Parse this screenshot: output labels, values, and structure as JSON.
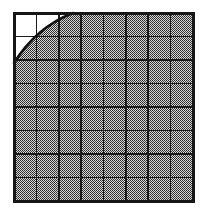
{
  "figure": {
    "type": "geometric-diagram",
    "canvas": {
      "width": 206,
      "height": 214,
      "background": "#ffffff"
    },
    "plot_area": {
      "left": 14,
      "top": 13,
      "right": 193,
      "bottom": 201,
      "width": 179,
      "height": 188
    },
    "grid": {
      "columns": 8,
      "rows": 8,
      "cell_width": 22.375,
      "cell_height": 23.5,
      "line_color": "#1a1a1a",
      "inner_line_width": 1.6,
      "border_line_width": 3.0,
      "border_color": "#161616"
    },
    "arc": {
      "shape": "quarter-circle",
      "concavity": "toward-top-left",
      "stroke_color": "#111111",
      "stroke_width": 2.6,
      "center_x": 193,
      "center_y": 201,
      "radius_x": 120,
      "radius_y": 138,
      "start_point_label": "top-edge-crossing",
      "start_x": 73,
      "start_y": 13,
      "end_point_label": "left-edge-crossing",
      "end_x": 14,
      "end_y": 63
    },
    "fill": {
      "region": "outside-arc",
      "pattern": "stipple-dots",
      "pattern_period_px": 2,
      "dot_color": "#2b2b2b",
      "background_color": "#d6d6d6",
      "unfilled_color": "#ffffff"
    },
    "unfilled_cells": [
      {
        "row": 1,
        "col": 1,
        "coverage": "full"
      },
      {
        "row": 1,
        "col": 2,
        "coverage": "partial-above-arc"
      },
      {
        "row": 2,
        "col": 1,
        "coverage": "partial-above-arc"
      },
      {
        "row": 2,
        "col": 2,
        "coverage": "sliver-above-arc"
      },
      {
        "row": 3,
        "col": 1,
        "coverage": "sliver-above-arc"
      }
    ]
  },
  "chart_data": {
    "type": "area",
    "xlabel": "",
    "ylabel": "",
    "grid": true,
    "legend": "none",
    "xlim": [
      0,
      8
    ],
    "ylim": [
      0,
      8
    ],
    "categories": [
      "1",
      "2",
      "3",
      "4",
      "5",
      "6",
      "7",
      "8"
    ],
    "series": [
      {
        "name": "arc",
        "description": "quarter circle from top edge at x=2.64 to left edge at y=5.87 measured from top",
        "x": [
          0.0,
          0.4,
          0.8,
          1.2,
          1.6,
          2.0,
          2.4,
          2.64
        ],
        "y": [
          5.87,
          5.6,
          5.2,
          4.6,
          3.8,
          2.8,
          1.5,
          0.0
        ]
      }
    ],
    "values": [
      1,
      1,
      1,
      1,
      1,
      1,
      1,
      1
    ],
    "annotations": [
      "region outside the arc is stippled gray",
      "region inside the arc corner is white"
    ]
  }
}
